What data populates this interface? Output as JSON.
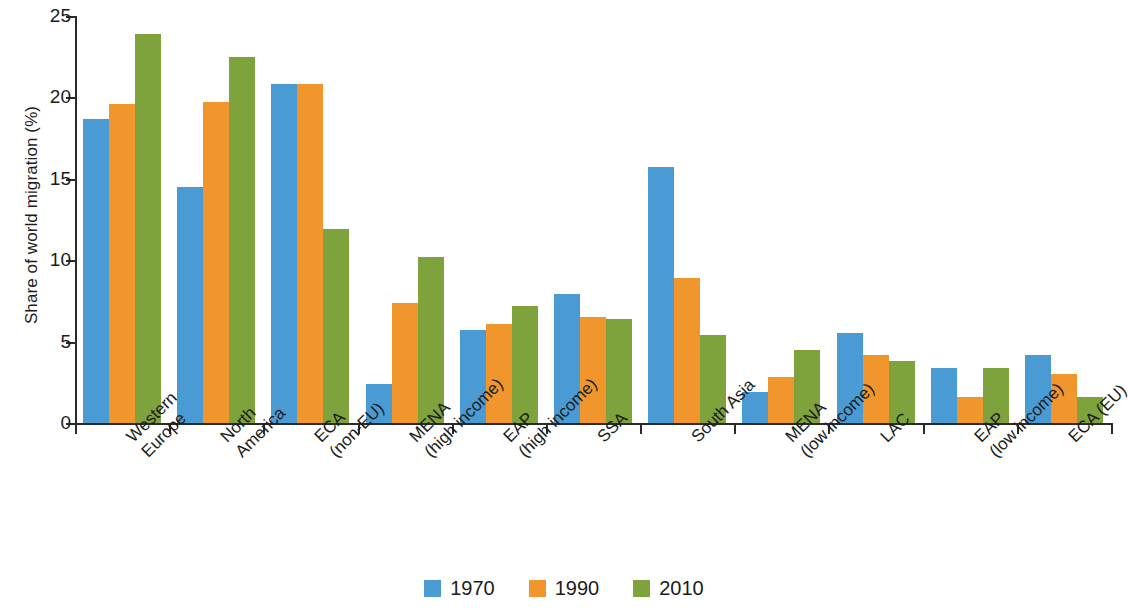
{
  "chart_data": {
    "type": "bar",
    "title": "",
    "subtitle": "",
    "xlabel": "",
    "ylabel": "Share of world migration (%)",
    "ylim": [
      0,
      25
    ],
    "yticks": [
      0,
      5,
      10,
      15,
      20,
      25
    ],
    "ytick_labels": [
      "0",
      "5",
      "10",
      "15",
      "20",
      "25"
    ],
    "grid": false,
    "legend_position": "bottom-center",
    "bar_group_orientation": "vertical",
    "xtick_label_rotation": -45,
    "categories": [
      "Western Europe",
      "North America",
      "ECA (non-EU)",
      "MENA (high income)",
      "EAP (high income)",
      "SSA",
      "South Asia",
      "MENA (low income)",
      "LAC",
      "EAP (low income)",
      "ECA (EU)"
    ],
    "category_lines": [
      [
        "Western",
        "Europe"
      ],
      [
        "North",
        "America"
      ],
      [
        "ECA",
        "(non-EU)"
      ],
      [
        "MENA",
        "(high income)"
      ],
      [
        "EAP",
        "(high income)"
      ],
      [
        "SSA",
        ""
      ],
      [
        "South Asia",
        ""
      ],
      [
        "MENA",
        "(low income)"
      ],
      [
        "LAC",
        ""
      ],
      [
        "EAP",
        "(low income)"
      ],
      [
        "ECA (EU)",
        ""
      ]
    ],
    "series": [
      {
        "name": "1970",
        "color": "#4a9bd4",
        "values": [
          18.7,
          14.5,
          20.8,
          2.4,
          5.7,
          7.9,
          15.7,
          1.9,
          5.5,
          3.4,
          4.2
        ]
      },
      {
        "name": "1990",
        "color": "#f0962d",
        "values": [
          19.6,
          19.7,
          20.8,
          7.4,
          6.1,
          6.5,
          8.9,
          2.8,
          4.2,
          1.6,
          3.0
        ]
      },
      {
        "name": "2010",
        "color": "#7fa33c",
        "values": [
          23.9,
          22.5,
          11.9,
          10.2,
          7.2,
          6.4,
          5.4,
          4.5,
          3.8,
          3.4,
          1.6
        ]
      }
    ]
  },
  "legend": {
    "items": [
      {
        "label": "1970",
        "color": "#4a9bd4"
      },
      {
        "label": "1990",
        "color": "#f0962d"
      },
      {
        "label": "2010",
        "color": "#7fa33c"
      }
    ]
  },
  "axis": {
    "y_title": "Share of world migration (%)"
  }
}
